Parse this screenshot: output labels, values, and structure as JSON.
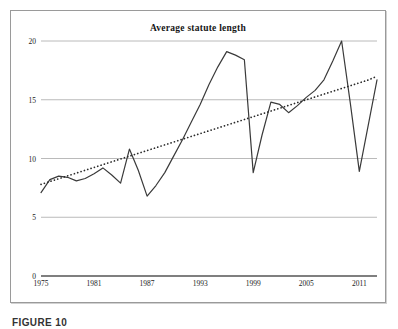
{
  "figure": {
    "caption": "FIGURE 10",
    "frame_color": "#9a9a9a",
    "background": "#ffffff"
  },
  "chart_data": {
    "type": "line",
    "title": "Average statute length",
    "xlabel": "",
    "ylabel": "",
    "xlim": [
      1975,
      2013
    ],
    "ylim": [
      0,
      20
    ],
    "yticks": [
      0,
      5,
      10,
      15,
      20
    ],
    "ytick_labels": [
      "0",
      "5",
      "10",
      "15",
      "20"
    ],
    "xticks": [
      1975,
      1981,
      1987,
      1993,
      1999,
      2005,
      2011
    ],
    "xtick_labels": [
      "1975",
      "1981",
      "1987",
      "1993",
      "1999",
      "2005",
      "2011"
    ],
    "grid": "horizontal",
    "legend": "none",
    "line_color": "#3a3a3a",
    "trend_color": "#2b2b2b",
    "grid_color": "#a8a8a8",
    "axis_color": "#555555",
    "x": [
      1975,
      1976,
      1977,
      1978,
      1979,
      1980,
      1981,
      1982,
      1983,
      1984,
      1985,
      1986,
      1987,
      1988,
      1989,
      1990,
      1991,
      1992,
      1993,
      1994,
      1995,
      1996,
      1997,
      1998,
      1999,
      2000,
      2001,
      2002,
      2003,
      2004,
      2005,
      2006,
      2007,
      2008,
      2009,
      2010,
      2011,
      2012,
      2013
    ],
    "series": [
      {
        "name": "Average statute length",
        "style": "solid",
        "values": [
          7.1,
          8.2,
          8.5,
          8.4,
          8.1,
          8.3,
          8.7,
          9.2,
          8.6,
          7.9,
          10.8,
          9.0,
          6.8,
          7.7,
          8.8,
          10.2,
          11.6,
          13.1,
          14.6,
          16.3,
          17.8,
          19.1,
          18.8,
          18.4,
          8.8,
          12.0,
          14.8,
          14.6,
          13.9,
          14.5,
          15.2,
          15.8,
          16.7,
          18.3,
          20.0,
          14.6,
          8.9,
          12.8,
          16.7
        ]
      },
      {
        "name": "Linear trend",
        "style": "dotted",
        "values": [
          7.8,
          8.04,
          8.28,
          8.52,
          8.76,
          9.0,
          9.24,
          9.48,
          9.72,
          9.96,
          10.2,
          10.44,
          10.68,
          10.92,
          11.16,
          11.4,
          11.64,
          11.88,
          12.12,
          12.36,
          12.6,
          12.84,
          13.08,
          13.32,
          13.56,
          13.8,
          14.04,
          14.28,
          14.52,
          14.76,
          15.0,
          15.24,
          15.48,
          15.72,
          15.96,
          16.2,
          16.44,
          16.68,
          17.0
        ]
      }
    ]
  }
}
